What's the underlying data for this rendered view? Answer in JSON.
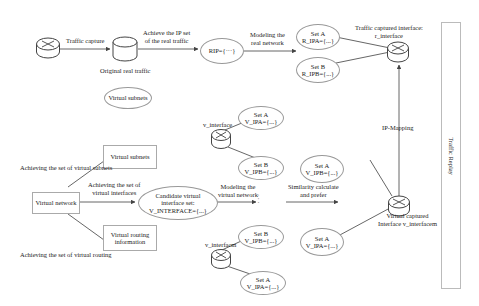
{
  "diagram": {
    "top_row": {
      "capture_label": "Traffic capture",
      "original_traffic_label": "Original real traffic",
      "achieve_ip_label_1": "Achieve the IP set",
      "achieve_ip_label_2": "of the real traffic",
      "rip_label": "RIP={···}",
      "modeling_real_1": "Modeling the",
      "modeling_real_2": "real network",
      "set_a_title": "Set A",
      "set_a_value": "R_IPA={...}",
      "set_b_title": "Set B",
      "set_b_value": "R_IPB={...}",
      "captured_iface_1": "Traffic captured interface:",
      "captured_iface_2": "r_interface",
      "virtual_subnets_ellipse": "Virtual subnets"
    },
    "left": {
      "virtual_network": "Virtual network",
      "virtual_subnets_box": "Virtual subnets",
      "virtual_routing_box_1": "Virtual routing",
      "virtual_routing_box_2": "information",
      "ach_subnets": "Achieving the set of virtual subnets",
      "ach_ifaces_1": "Achieving the set of",
      "ach_ifaces_2": "virtual interfaces",
      "ach_routing": "Achieving the set of virtual routing"
    },
    "middle": {
      "candidate_1": "Candidate virtual",
      "candidate_2": "interface set:",
      "candidate_3": "V_INTERFACE={...}",
      "modeling_virtual_1": "Modeling the",
      "modeling_virtual_2": "virtual network",
      "dots": "·  ·  ·",
      "v_iface_top": "v_interface",
      "top_set_a_title": "Set A",
      "top_set_a_value": "V_IPA={...}",
      "top_set_b_title": "Set B",
      "top_set_b_value": "V_IPB={...}",
      "v_iface_bottom": "v_interfacm",
      "bot_set_b_title": "Set B",
      "bot_set_b_value": "V_IPB={...}",
      "bot_set_a_title": "Set A",
      "bot_set_a_value": "V_IPA={...}"
    },
    "right": {
      "similarity_1": "Similarity calculate",
      "similarity_2": "and prefer",
      "r_set_a_title": "Set A",
      "r_set_a_value": "V_IPB={...}",
      "r_set_a2_title": "Set A",
      "r_set_a2_value": "V_IPA={...}",
      "ip_mapping": "IP-Mapping",
      "virtual_captured_1": "Virtual captured",
      "virtual_captured_2": "Interface v_interfacem",
      "traffic_replay": "Traffic Replay"
    }
  }
}
